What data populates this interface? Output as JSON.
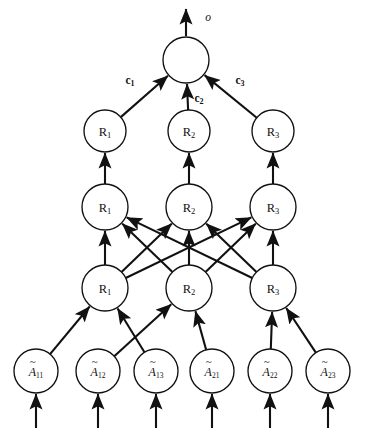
{
  "figure": {
    "type": "neural-network-diagram",
    "background_color": "#ffffff",
    "stroke_color": "#111111",
    "width": 366,
    "height": 433
  },
  "output": {
    "label": "o",
    "arrow_name": "output-arrow",
    "node_label": ""
  },
  "coefficients": [
    {
      "id": "c1",
      "base": "c",
      "sub": "1"
    },
    {
      "id": "c2",
      "base": "c",
      "sub": "2"
    },
    {
      "id": "c3",
      "base": "c",
      "sub": "3"
    }
  ],
  "layers": [
    {
      "name": "output-node-layer",
      "nodes": [
        {
          "id": "out",
          "base": "",
          "sub": "",
          "cx": 186,
          "cy": 60,
          "r": 23
        }
      ]
    },
    {
      "name": "rule-layer-4",
      "nodes": [
        {
          "id": "L4R1",
          "base": "R",
          "sub": "1",
          "cx": 105,
          "cy": 131,
          "r": 21
        },
        {
          "id": "L4R2",
          "base": "R",
          "sub": "2",
          "cx": 189,
          "cy": 131,
          "r": 21
        },
        {
          "id": "L4R3",
          "base": "R",
          "sub": "3",
          "cx": 273,
          "cy": 131,
          "r": 21
        }
      ]
    },
    {
      "name": "rule-layer-3",
      "nodes": [
        {
          "id": "L3R1",
          "base": "R",
          "sub": "1",
          "cx": 105,
          "cy": 207,
          "r": 23
        },
        {
          "id": "L3R2",
          "base": "R",
          "sub": "2",
          "cx": 189,
          "cy": 207,
          "r": 23
        },
        {
          "id": "L3R3",
          "base": "R",
          "sub": "3",
          "cx": 273,
          "cy": 207,
          "r": 23
        }
      ]
    },
    {
      "name": "rule-layer-2",
      "nodes": [
        {
          "id": "L2R1",
          "base": "R",
          "sub": "1",
          "cx": 105,
          "cy": 288,
          "r": 23
        },
        {
          "id": "L2R2",
          "base": "R",
          "sub": "2",
          "cx": 189,
          "cy": 288,
          "r": 23
        },
        {
          "id": "L2R3",
          "base": "R",
          "sub": "3",
          "cx": 273,
          "cy": 288,
          "r": 23
        }
      ]
    },
    {
      "name": "input-layer",
      "nodes": [
        {
          "id": "A11",
          "base": "A",
          "sub": "11",
          "cx": 36,
          "cy": 371,
          "r": 22
        },
        {
          "id": "A12",
          "base": "A",
          "sub": "12",
          "cx": 98,
          "cy": 371,
          "r": 22
        },
        {
          "id": "A13",
          "base": "A",
          "sub": "13",
          "cx": 156,
          "cy": 371,
          "r": 22
        },
        {
          "id": "A21",
          "base": "A",
          "sub": "21",
          "cx": 212,
          "cy": 371,
          "r": 22
        },
        {
          "id": "A22",
          "base": "A",
          "sub": "22",
          "cx": 270,
          "cy": 371,
          "r": 22
        },
        {
          "id": "A23",
          "base": "A",
          "sub": "23",
          "cx": 328,
          "cy": 371,
          "r": 22
        }
      ]
    }
  ],
  "connections": {
    "input_to_layer2": [
      [
        "A11",
        "L2R1"
      ],
      [
        "A13",
        "L2R1"
      ],
      [
        "A12",
        "L2R2"
      ],
      [
        "A21",
        "L2R2"
      ],
      [
        "A22",
        "L2R3"
      ],
      [
        "A23",
        "L2R3"
      ]
    ],
    "layer2_to_layer3_fully_connected": true,
    "layer3_to_layer4_vertical": [
      [
        "L3R1",
        "L4R1"
      ],
      [
        "L3R2",
        "L4R2"
      ],
      [
        "L3R3",
        "L4R3"
      ]
    ],
    "layer4_to_output": [
      [
        "L4R1",
        "out",
        "c1"
      ],
      [
        "L4R2",
        "out",
        "c2"
      ],
      [
        "L4R3",
        "out",
        "c3"
      ]
    ],
    "bottom_input_arrows": 6
  }
}
